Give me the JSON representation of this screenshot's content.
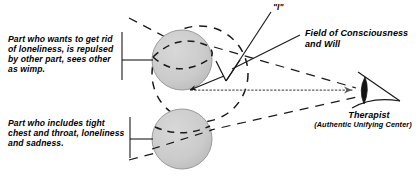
{
  "diagram": {
    "background_color": "#ffffff",
    "stroke_color": "#1a1a1a",
    "circle_fill_color": "#cccccc",
    "circle_stroke_color": "#8c8c8c",
    "labels": {
      "part_upper": "Part who wants to get rid of loneliness, is repulsed by other part, sees other as wimp.",
      "part_lower": "Part who includes tight chest and throat, loneliness and sadness.",
      "i_marker": "\"I\"",
      "field": "Field of Consciousness and Will",
      "therapist": "Therapist",
      "therapist_sub": "(Authentic Unifying Center)"
    },
    "shapes": {
      "upper_part_circle": {
        "cx": 182,
        "cy": 60,
        "r": 30,
        "name": "upper-part-circle"
      },
      "lower_part_circle": {
        "cx": 182,
        "cy": 139,
        "r": 30,
        "name": "lower-part-circle"
      },
      "field_circle": {
        "cx": 200,
        "cy": 74,
        "r": 48,
        "name": "field-of-consciousness-circle",
        "style": "dashed"
      },
      "therapist_eye": {
        "cx": 365,
        "cy": 92,
        "name": "therapist-eye"
      },
      "i_point": {
        "x": 226,
        "y": 80,
        "name": "i-vertex"
      }
    },
    "connectors": [
      {
        "name": "upper-part-leader",
        "type": "solid"
      },
      {
        "name": "lower-part-leader",
        "type": "solid"
      },
      {
        "name": "i-leader-line",
        "type": "solid"
      },
      {
        "name": "field-leader-line",
        "type": "solid"
      },
      {
        "name": "gaze-arrow",
        "type": "dotted"
      },
      {
        "name": "cone-upper-edge",
        "type": "dashed"
      },
      {
        "name": "cone-lower-edge",
        "type": "dashed"
      },
      {
        "name": "part-axis-upper",
        "type": "dashed"
      },
      {
        "name": "part-axis-lower",
        "type": "dashed"
      }
    ]
  }
}
